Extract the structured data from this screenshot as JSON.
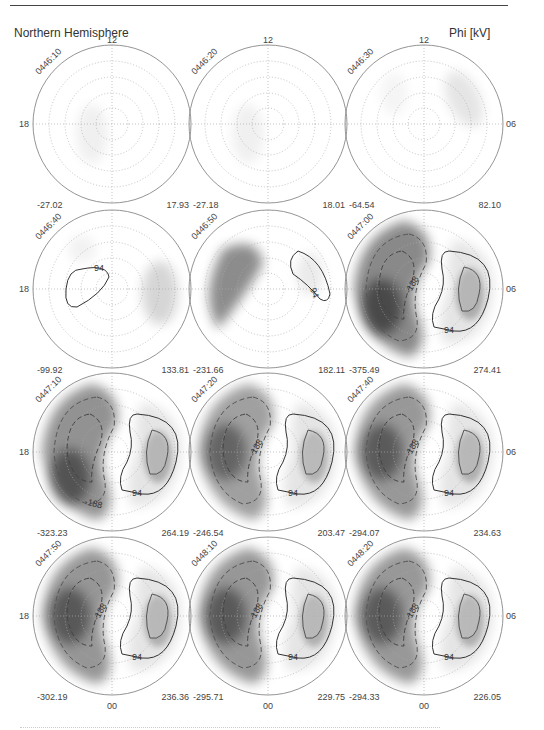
{
  "header": {
    "left_title": "Northern Hemisphere",
    "right_title": "Phi [kV]"
  },
  "chart_data": {
    "type": "heatmap",
    "title": "Northern Hemisphere",
    "colorbar_label": "Phi [kV]",
    "layout": {
      "rows": 4,
      "cols": 3,
      "projection": "polar (magnetic local time dial)"
    },
    "mlt_tick_labels": {
      "top": "12",
      "left": "18",
      "right": "06",
      "bottom": "00"
    },
    "contour_levels_labeled": [
      94,
      -188
    ],
    "grid": true,
    "panels": [
      {
        "time": "0446:10",
        "min": "-27.02",
        "max": "17.93",
        "contours": []
      },
      {
        "time": "0446:20",
        "min": "-27.18",
        "max": "18.01",
        "contours": []
      },
      {
        "time": "0446:30",
        "min": "-64.54",
        "max": "82.10",
        "contours": []
      },
      {
        "time": "0446:40",
        "min": "-99.92",
        "max": "133.81",
        "contours": [
          "94"
        ]
      },
      {
        "time": "0446:50",
        "min": "-231.66",
        "max": "182.11",
        "contours": [
          "94"
        ]
      },
      {
        "time": "0447:00",
        "min": "-375.49",
        "max": "274.41",
        "contours": [
          "94",
          "-188"
        ]
      },
      {
        "time": "0447:10",
        "min": "-323.23",
        "max": "264.19",
        "contours": [
          "94",
          "-188"
        ]
      },
      {
        "time": "0447:20",
        "min": "-246.54",
        "max": "203.47",
        "contours": [
          "94",
          "-188"
        ]
      },
      {
        "time": "0447:40",
        "min": "-294.07",
        "max": "234.63",
        "contours": [
          "94",
          "-188"
        ]
      },
      {
        "time": "0447:50",
        "min": "-302.19",
        "max": "236.36",
        "contours": [
          "94",
          "-188"
        ]
      },
      {
        "time": "0448:10",
        "min": "-295.71",
        "max": "229.75",
        "contours": [
          "94",
          "-188"
        ]
      },
      {
        "time": "0448:20",
        "min": "-294.33",
        "max": "226.05",
        "contours": [
          "94",
          "-188"
        ]
      }
    ]
  }
}
